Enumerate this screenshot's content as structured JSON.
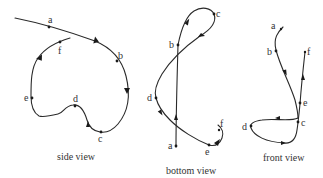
{
  "figure": {
    "type": "trajectory-projections",
    "colors": {
      "stroke": "#2a2a2a",
      "text": "#333333",
      "background": "#ffffff"
    },
    "views": [
      {
        "id": "side",
        "caption": "side view",
        "points": [
          {
            "label": "a",
            "x": 49,
            "y": 27
          },
          {
            "label": "b",
            "x": 117,
            "y": 62
          },
          {
            "label": "c",
            "x": 101,
            "y": 132
          },
          {
            "label": "d",
            "x": 75,
            "y": 107
          },
          {
            "label": "e",
            "x": 32,
            "y": 98
          },
          {
            "label": "f",
            "x": 60,
            "y": 42
          }
        ]
      },
      {
        "id": "bottom",
        "caption": "bottom view",
        "points": [
          {
            "label": "a",
            "x": 176,
            "y": 146
          },
          {
            "label": "b",
            "x": 178,
            "y": 45
          },
          {
            "label": "c",
            "x": 213,
            "y": 14
          },
          {
            "label": "d",
            "x": 156,
            "y": 98
          },
          {
            "label": "e",
            "x": 209,
            "y": 145
          },
          {
            "label": "f",
            "x": 220,
            "y": 130
          }
        ]
      },
      {
        "id": "front",
        "caption": "front view",
        "points": [
          {
            "label": "a",
            "x": 279,
            "y": 30
          },
          {
            "label": "b",
            "x": 276,
            "y": 51
          },
          {
            "label": "c",
            "x": 298,
            "y": 122
          },
          {
            "label": "d",
            "x": 251,
            "y": 126
          },
          {
            "label": "e",
            "x": 300,
            "y": 103
          },
          {
            "label": "f",
            "x": 305,
            "y": 52
          }
        ]
      }
    ]
  }
}
